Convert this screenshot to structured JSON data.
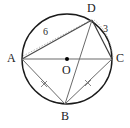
{
  "figure": {
    "type": "circle-geometry-diagram",
    "title": "",
    "circle": {
      "center_label": "O",
      "center_x": 67,
      "center_y": 59,
      "radius": 45,
      "stroke": "#1a1a1a"
    },
    "points": [
      {
        "id": "A",
        "label": "A",
        "x": 22,
        "y": 59,
        "label_x": 7,
        "label_y": 52
      },
      {
        "id": "B",
        "label": "B",
        "x": 65,
        "y": 104,
        "label_x": 61,
        "label_y": 110
      },
      {
        "id": "C",
        "label": "C",
        "x": 112,
        "y": 59,
        "label_x": 116,
        "label_y": 52
      },
      {
        "id": "D",
        "label": "D",
        "x": 92,
        "y": 20,
        "label_x": 87,
        "label_y": 3
      },
      {
        "id": "O",
        "label": "O",
        "x": 67,
        "y": 59,
        "label_x": 62,
        "label_y": 64
      }
    ],
    "segments": [
      {
        "name": "chord-AD",
        "from": "A",
        "to": "D",
        "style": "solid",
        "measure": "6"
      },
      {
        "name": "chord-DC",
        "from": "D",
        "to": "C",
        "style": "solid",
        "measure": "3"
      },
      {
        "name": "diameter-AC",
        "from": "A",
        "to": "C",
        "style": "solid",
        "measure": ""
      },
      {
        "name": "chord-AB",
        "from": "A",
        "to": "B",
        "style": "solid",
        "measure": "",
        "tick": "x"
      },
      {
        "name": "chord-BC",
        "from": "B",
        "to": "C",
        "style": "solid",
        "measure": "",
        "tick": "x"
      },
      {
        "name": "diagonal-DB",
        "from": "D",
        "to": "B",
        "style": "solid",
        "measure": ""
      },
      {
        "name": "auxiliary-AD-dotted",
        "from": "A",
        "to": "D",
        "style": "dotted",
        "measure": ""
      },
      {
        "name": "auxiliary-DC-dotted",
        "from": "D",
        "to": "C",
        "style": "dotted",
        "measure": ""
      }
    ],
    "labels": {
      "A": "A",
      "B": "B",
      "C": "C",
      "D": "D",
      "O": "O",
      "side_AD": "6",
      "side_DC": "3"
    },
    "label_positions": {
      "side_AD": {
        "x": 43,
        "y": 27
      },
      "side_DC": {
        "x": 103,
        "y": 25
      }
    },
    "tick_marks": [
      {
        "name": "tick-AB",
        "x": 44,
        "y": 84,
        "glyph": "x"
      },
      {
        "name": "tick-BC",
        "x": 88,
        "y": 83,
        "glyph": "x"
      }
    ],
    "colors": {
      "circle_stroke": "#1a1a1a",
      "chord_stroke": "#4a4a4a",
      "dotted_stroke": "#9a9a9a",
      "text": "#1a1a1a",
      "center_dot": "#000000",
      "background": "#ffffff"
    }
  }
}
